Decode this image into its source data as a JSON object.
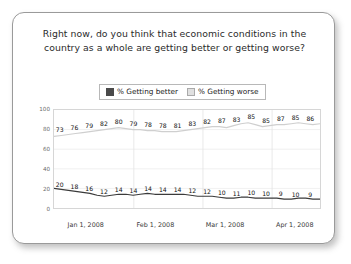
{
  "card": {
    "title": "Right now, do you think that economic conditions in the country as a whole are getting better or getting worse?"
  },
  "legend": {
    "items": [
      {
        "label": "% Getting better",
        "color": "#4a4a4a",
        "swatch": "dark"
      },
      {
        "label": "% Getting worse",
        "color": "#e0e0e0",
        "swatch": "light"
      }
    ]
  },
  "chart_data": {
    "type": "line",
    "title": "Right now, do you think that economic conditions in the country as a whole are getting better or getting worse?",
    "xlabel": "",
    "ylabel": "",
    "ylim": [
      0,
      100
    ],
    "yticks": [
      0,
      20,
      40,
      60,
      80,
      100
    ],
    "grid": "vertical-month-boundaries",
    "legend_position": "top-center",
    "x_tick_labels": [
      "Jan 1, 2008",
      "Feb 1, 2008",
      "Mar 1, 2008",
      "Apr 1, 2008"
    ],
    "x_tick_positions_pct": [
      4,
      30,
      56,
      82
    ],
    "label_positions_pct": [
      2.5,
      8,
      13.5,
      19,
      24.5,
      30,
      35.5,
      41,
      46.5,
      52,
      57.5,
      63,
      68.5,
      74,
      79.5,
      85,
      90.5,
      96
    ],
    "series": [
      {
        "name": "% Getting worse",
        "color": "#cfcfcf",
        "labels": [
          73,
          76,
          79,
          82,
          80,
          79,
          78,
          78,
          81,
          83,
          82,
          87,
          83,
          85,
          85,
          87,
          85,
          86
        ],
        "values": [
          73,
          74,
          75,
          76,
          77,
          78,
          79,
          80,
          81,
          82,
          81,
          80,
          80,
          79,
          79,
          78,
          78,
          78,
          79,
          80,
          81,
          82,
          83,
          83,
          82,
          84,
          86,
          87,
          85,
          83,
          84,
          85,
          85,
          86,
          87,
          86,
          85,
          86
        ]
      },
      {
        "name": "% Getting better",
        "color": "#3b3b3b",
        "labels": [
          20,
          18,
          16,
          12,
          14,
          14,
          14,
          14,
          14,
          12,
          12,
          10,
          11,
          10,
          10,
          9,
          10,
          9
        ],
        "values": [
          20,
          19,
          18,
          17,
          16,
          15,
          13,
          12,
          13,
          14,
          14,
          13,
          14,
          15,
          14,
          14,
          14,
          14,
          14,
          13,
          12,
          12,
          12,
          11,
          10,
          10,
          11,
          11,
          10,
          10,
          10,
          10,
          9,
          9,
          10,
          10,
          9,
          9
        ]
      }
    ]
  }
}
